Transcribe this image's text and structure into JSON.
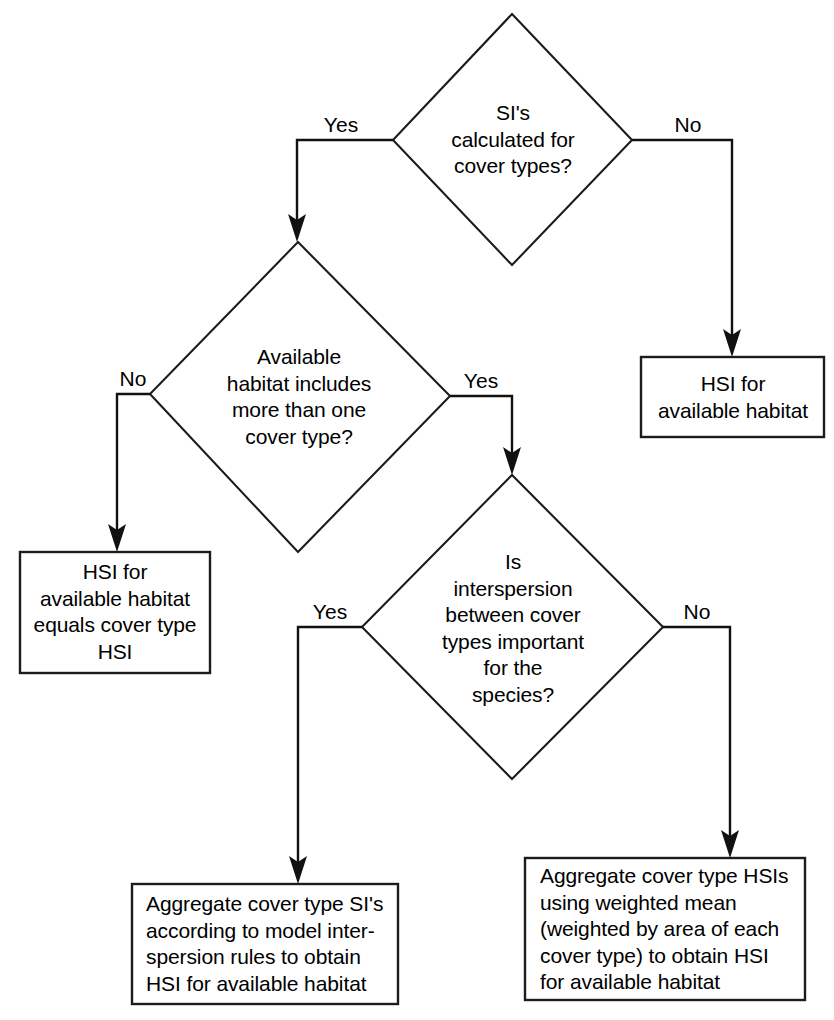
{
  "diagram": {
    "background_color": "#ffffff",
    "line_color": "#1c1c1c",
    "text_color": "#000000"
  },
  "nodes": {
    "decision_si_cover_types": {
      "type": "decision",
      "text": "SI's\ncalculated for\ncover types?"
    },
    "decision_available_habitat": {
      "type": "decision",
      "text": "Available\nhabitat includes\nmore than one\ncover type?"
    },
    "decision_interspersion": {
      "type": "decision",
      "text": "Is\ninterspersion\nbetween cover\ntypes important\nfor the\nspecies?"
    },
    "box_hsi_available_habitat": {
      "type": "process",
      "text": "HSI for\navailable habitat"
    },
    "box_hsi_equals_cover_type": {
      "type": "process",
      "text": "HSI for\navailable habitat\nequals cover type\nHSI"
    },
    "box_aggregate_si_interspersion": {
      "type": "process",
      "text": "Aggregate cover type SI's\naccording to model inter-\nspersion rules to obtain\nHSI for available habitat"
    },
    "box_aggregate_hsi_weighted": {
      "type": "process",
      "text": "Aggregate cover type HSIs\nusing weighted mean\n(weighted by area of each\ncover type) to obtain HSI\nfor available habitat"
    }
  },
  "edges": {
    "si_yes": {
      "label": "Yes",
      "from": "decision_si_cover_types",
      "to": "decision_available_habitat"
    },
    "si_no": {
      "label": "No",
      "from": "decision_si_cover_types",
      "to": "box_hsi_available_habitat"
    },
    "habitat_no": {
      "label": "No",
      "from": "decision_available_habitat",
      "to": "box_hsi_equals_cover_type"
    },
    "habitat_yes": {
      "label": "Yes",
      "from": "decision_available_habitat",
      "to": "decision_interspersion"
    },
    "interspersion_yes": {
      "label": "Yes",
      "from": "decision_interspersion",
      "to": "box_aggregate_si_interspersion"
    },
    "interspersion_no": {
      "label": "No",
      "from": "decision_interspersion",
      "to": "box_aggregate_hsi_weighted"
    }
  }
}
